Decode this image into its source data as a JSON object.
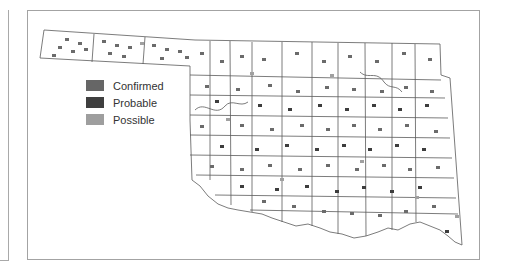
{
  "map": {
    "region": "Oklahoma counties",
    "boundary_color": "#555555",
    "marker_size": 4,
    "markers": {
      "confirmed_color": "#6b6b6b",
      "probable_color": "#3d3d3d",
      "possible_color": "#a0a0a0"
    }
  },
  "legend": {
    "items": [
      {
        "label": "Confirmed",
        "color": "#666666"
      },
      {
        "label": "Probable",
        "color": "#3f3f3f"
      },
      {
        "label": "Possible",
        "color": "#9e9e9e"
      }
    ]
  }
}
